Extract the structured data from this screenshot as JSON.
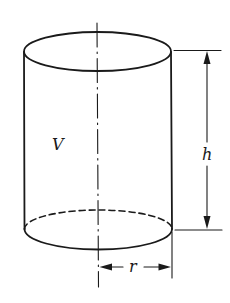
{
  "diagram": {
    "labels": {
      "volume": "V",
      "height": "h",
      "radius": "r"
    },
    "colors": {
      "stroke": "#1a1a1a",
      "background": "#ffffff"
    }
  }
}
